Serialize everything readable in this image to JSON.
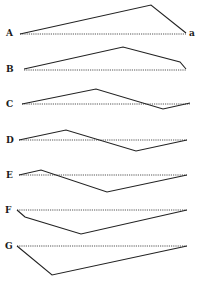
{
  "figure": {
    "rows": [
      {
        "label": "A",
        "end_label": "a",
        "label_pos": [
          6,
          36
        ],
        "baseline": [
          [
            20,
            34
          ],
          [
            186,
            34
          ]
        ],
        "path": [
          [
            20,
            34
          ],
          [
            151,
            5
          ],
          [
            186,
            33
          ]
        ]
      },
      {
        "label": "B",
        "end_label": "",
        "label_pos": [
          6,
          72
        ],
        "baseline": [
          [
            24,
            70
          ],
          [
            186,
            70
          ]
        ],
        "path": [
          [
            24,
            69
          ],
          [
            123,
            47
          ],
          [
            180,
            62
          ],
          [
            186,
            69
          ]
        ]
      },
      {
        "label": "C",
        "end_label": "",
        "label_pos": [
          6,
          107
        ],
        "baseline": [
          [
            22,
            104
          ],
          [
            190,
            104
          ]
        ],
        "path": [
          [
            22,
            104
          ],
          [
            96,
            89
          ],
          [
            163,
            109
          ],
          [
            190,
            103
          ]
        ]
      },
      {
        "label": "D",
        "end_label": "",
        "label_pos": [
          6,
          143
        ],
        "baseline": [
          [
            19,
            140
          ],
          [
            187,
            140
          ]
        ],
        "path": [
          [
            19,
            140
          ],
          [
            66,
            130
          ],
          [
            136,
            151
          ],
          [
            187,
            140
          ]
        ]
      },
      {
        "label": "E",
        "end_label": "",
        "label_pos": [
          6,
          178
        ],
        "baseline": [
          [
            19,
            175
          ],
          [
            187,
            175
          ]
        ],
        "path": [
          [
            19,
            175
          ],
          [
            41,
            170
          ],
          [
            107,
            192
          ],
          [
            187,
            175
          ]
        ]
      },
      {
        "label": "F",
        "end_label": "",
        "label_pos": [
          5,
          213
        ],
        "baseline": [
          [
            17,
            210
          ],
          [
            187,
            210
          ]
        ],
        "path": [
          [
            17,
            210
          ],
          [
            25,
            217
          ],
          [
            81,
            234
          ],
          [
            187,
            210
          ]
        ]
      },
      {
        "label": "G",
        "end_label": "",
        "label_pos": [
          5,
          249
        ],
        "baseline": [
          [
            17,
            246
          ],
          [
            187,
            246
          ]
        ],
        "path": [
          [
            17,
            246
          ],
          [
            52,
            275
          ],
          [
            187,
            246
          ]
        ]
      }
    ],
    "end_label_pos": [
      189,
      36
    ]
  }
}
